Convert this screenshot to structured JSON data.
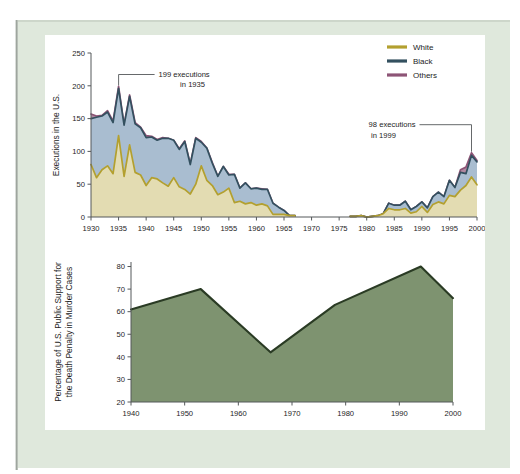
{
  "figure": {
    "background_color": "#dfe8dc",
    "panel_color": "#ffffff"
  },
  "chart_data": [
    {
      "id": "executions",
      "type": "area",
      "stacked": true,
      "title": "",
      "xlabel": "",
      "ylabel": "Executions in the U.S.",
      "xlim": [
        1930,
        2000
      ],
      "ylim": [
        0,
        250
      ],
      "xticks": [
        1930,
        1935,
        1940,
        1945,
        1950,
        1955,
        1960,
        1965,
        1970,
        1975,
        1980,
        1985,
        1990,
        1995,
        2000
      ],
      "yticks": [
        0,
        50,
        100,
        150,
        200,
        250
      ],
      "grid": false,
      "legend_position": "top-right",
      "legend": [
        "White",
        "Black",
        "Others"
      ],
      "colors": {
        "White": "#b3a02f",
        "Black": "#33505f",
        "Others": "#8d5476",
        "White_fill": "#e3dcb2",
        "Black_fill": "#a9bdd0",
        "Others_fill": "#b089a0"
      },
      "x": [
        1930,
        1931,
        1932,
        1933,
        1934,
        1935,
        1936,
        1937,
        1938,
        1939,
        1940,
        1941,
        1942,
        1943,
        1944,
        1945,
        1946,
        1947,
        1948,
        1949,
        1950,
        1951,
        1952,
        1953,
        1954,
        1955,
        1956,
        1957,
        1958,
        1959,
        1960,
        1961,
        1962,
        1963,
        1964,
        1965,
        1966,
        1967,
        1977,
        1978,
        1979,
        1980,
        1981,
        1982,
        1983,
        1984,
        1985,
        1986,
        1987,
        1988,
        1989,
        1990,
        1991,
        1992,
        1993,
        1994,
        1995,
        1996,
        1997,
        1998,
        1999,
        2000
      ],
      "series": [
        {
          "name": "White",
          "values": [
            80,
            60,
            72,
            78,
            66,
            124,
            62,
            110,
            68,
            64,
            48,
            60,
            58,
            52,
            47,
            60,
            46,
            42,
            35,
            50,
            78,
            56,
            48,
            34,
            38,
            44,
            22,
            24,
            20,
            22,
            18,
            20,
            17,
            4,
            4,
            4,
            2,
            2,
            1,
            1,
            2,
            0,
            1,
            2,
            5,
            13,
            11,
            11,
            13,
            6,
            8,
            16,
            7,
            19,
            23,
            20,
            33,
            31,
            41,
            48,
            61,
            49
          ]
        },
        {
          "name": "Black",
          "values": [
            70,
            92,
            82,
            82,
            78,
            72,
            78,
            74,
            74,
            72,
            73,
            62,
            59,
            68,
            73,
            57,
            57,
            73,
            45,
            70,
            36,
            49,
            34,
            28,
            39,
            20,
            43,
            20,
            32,
            21,
            26,
            22,
            25,
            17,
            11,
            6,
            0,
            0,
            0,
            0,
            0,
            0,
            0,
            0,
            0,
            8,
            7,
            7,
            11,
            5,
            8,
            7,
            7,
            12,
            15,
            11,
            23,
            14,
            27,
            18,
            33,
            35
          ]
        },
        {
          "name": "Others",
          "values": [
            7,
            2,
            1,
            2,
            2,
            3,
            1,
            2,
            2,
            1,
            3,
            1,
            1,
            1,
            0,
            0,
            1,
            1,
            1,
            1,
            1,
            0,
            1,
            0,
            0,
            1,
            0,
            0,
            0,
            0,
            0,
            1,
            0,
            0,
            0,
            0,
            0,
            0,
            0,
            0,
            0,
            0,
            0,
            0,
            0,
            0,
            0,
            0,
            0,
            0,
            0,
            0,
            0,
            0,
            0,
            0,
            0,
            0,
            4,
            10,
            4,
            2
          ]
        }
      ],
      "annotations": [
        {
          "id": "peak-1935",
          "line1": "199 executions",
          "line2": "in 1935",
          "point_x": 1935,
          "point_y": 199
        },
        {
          "id": "peak-1999",
          "line1": "98 executions",
          "line2": "in 1999",
          "point_x": 1999,
          "point_y": 98
        }
      ]
    },
    {
      "id": "public-support",
      "type": "area",
      "stacked": false,
      "title": "",
      "xlabel": "",
      "ylabel_line1": "Percentage of  U.S. Public Support for",
      "ylabel_line2": "the Death Penalty in Murder Cases",
      "xlim": [
        1940,
        2000
      ],
      "ylim": [
        20,
        82
      ],
      "xticks": [
        1940,
        1950,
        1960,
        1970,
        1980,
        1990,
        2000
      ],
      "yticks": [
        20,
        30,
        40,
        50,
        60,
        70,
        80
      ],
      "grid": false,
      "colors": {
        "area_fill": "#7e9370",
        "line": "#2a3b24"
      },
      "x": [
        1940,
        1953,
        1966,
        1978,
        1994,
        2000
      ],
      "values": [
        61,
        70,
        42,
        63,
        80,
        66
      ]
    }
  ]
}
